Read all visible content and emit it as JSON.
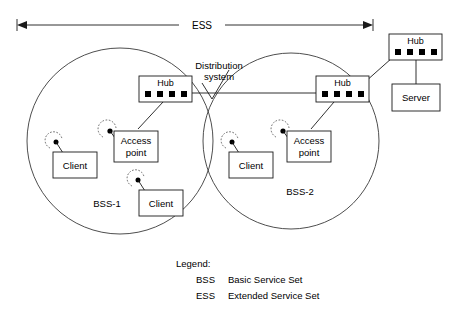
{
  "diagram": {
    "title_span": {
      "label": "ESS"
    },
    "distribution": {
      "line1": "Distribution",
      "line2": "system"
    },
    "cells": [
      {
        "name": "BSS-1",
        "label": "BSS-1"
      },
      {
        "name": "BSS-2",
        "label": "BSS-2"
      }
    ],
    "nodes": {
      "hub_left": {
        "label": "Hub",
        "ports": 4
      },
      "hub_right": {
        "label": "Hub",
        "ports": 4
      },
      "hub_top": {
        "label": "Hub",
        "ports": 4
      },
      "server": {
        "label": "Server"
      },
      "access_point_left": {
        "line1": "Access",
        "line2": "point"
      },
      "access_point_right": {
        "line1": "Access",
        "line2": "point"
      },
      "client_left_1": {
        "label": "Client"
      },
      "client_left_2": {
        "label": "Client"
      },
      "client_right_1": {
        "label": "Client"
      }
    },
    "legend": {
      "heading": "Legend:",
      "entries": [
        {
          "abbr": "BSS",
          "text": "Basic Service Set"
        },
        {
          "abbr": "ESS",
          "text": "Extended Service Set"
        }
      ]
    },
    "colors": {
      "stroke": "#1a1a1a",
      "circle": "#3a3a3a",
      "background": "#ffffff",
      "port": "#000000"
    }
  }
}
